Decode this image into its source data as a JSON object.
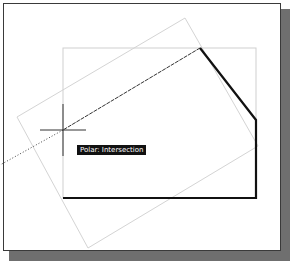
{
  "viewport": {
    "background": "#ffffff",
    "shadow_color": "#6f6f6f",
    "border_color": "#3a3a3a"
  },
  "drawing": {
    "reference_rectangle": {
      "color": "#cfcfcf"
    },
    "rotated_rectangle": {
      "color": "#d4d4d4"
    },
    "polyline": {
      "color": "#111111"
    },
    "tracking_line": {
      "color": "#333333"
    },
    "crosshair": {
      "color": "#333333"
    }
  },
  "tooltip": {
    "text": "Polar: Intersection"
  }
}
